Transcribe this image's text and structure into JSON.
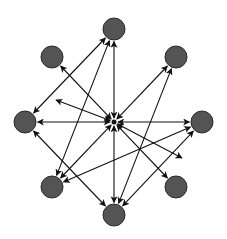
{
  "diagram": {
    "type": "network-graph",
    "colors": {
      "node_fill": "#545454",
      "node_stroke": "#2a2a2a",
      "edge": "#111111",
      "background": "#ffffff"
    },
    "node_radius": 11,
    "hub": {
      "id": "hub",
      "x": 114,
      "y": 122
    },
    "nodes": [
      {
        "id": "top",
        "x": 114,
        "y": 29
      },
      {
        "id": "upper-left",
        "x": 52,
        "y": 57
      },
      {
        "id": "upper-right",
        "x": 176,
        "y": 57
      },
      {
        "id": "left",
        "x": 25,
        "y": 122
      },
      {
        "id": "right",
        "x": 202,
        "y": 122
      },
      {
        "id": "lower-left",
        "x": 52,
        "y": 187
      },
      {
        "id": "lower-right",
        "x": 176,
        "y": 187
      },
      {
        "id": "bottom",
        "x": 114,
        "y": 215
      }
    ],
    "edges": [
      {
        "from": "hub",
        "to": "top",
        "both": true
      },
      {
        "from": "hub",
        "to": "upper-left",
        "both": true
      },
      {
        "from": "hub",
        "to": "upper-right",
        "both": true
      },
      {
        "from": "hub",
        "to": "left",
        "both": true
      },
      {
        "from": "hub",
        "to": "right",
        "both": true
      },
      {
        "from": "hub",
        "to": "lower-left",
        "both": true
      },
      {
        "from": "hub",
        "to": "lower-right",
        "both": true
      },
      {
        "from": "hub",
        "to": "bottom",
        "both": true
      },
      {
        "from": "hub",
        "to": "free-left",
        "both": true,
        "x2": 56,
        "y2": 100
      },
      {
        "from": "hub",
        "to": "free-right",
        "both": true,
        "x2": 182,
        "y2": 158
      },
      {
        "from": "left",
        "to": "top",
        "both": true
      },
      {
        "from": "lower-left",
        "to": "top",
        "both": true
      },
      {
        "from": "bottom",
        "to": "upper-right",
        "both": true
      },
      {
        "from": "lower-left",
        "to": "right",
        "both": true
      },
      {
        "from": "bottom",
        "to": "right",
        "both": true
      },
      {
        "from": "left",
        "to": "bottom",
        "both": true
      }
    ]
  }
}
